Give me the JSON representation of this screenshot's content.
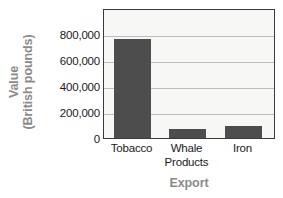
{
  "chart_data": {
    "type": "bar",
    "title": "",
    "xlabel": "Export",
    "ylabel": "Value (British pounds)",
    "ylabel_line1": "Value",
    "ylabel_line2": "(British pounds)",
    "categories": [
      "Tobacco",
      "Whale Products",
      "Iron"
    ],
    "category_lines": [
      [
        "Tobacco"
      ],
      [
        "Whale",
        "Products"
      ],
      [
        "Iron"
      ]
    ],
    "values": [
      760000,
      70000,
      90000
    ],
    "ylim": [
      0,
      1000000
    ],
    "yticks": [
      800000,
      600000,
      400000,
      200000,
      0
    ],
    "ytick_labels": [
      "800,000",
      "600,000",
      "400,000",
      "200,000",
      "0"
    ],
    "grid": true,
    "legend": false,
    "colors": {
      "bar": "#4d4d4d",
      "plot_background": "#f7f7f5",
      "plot_border": "#3a3a3a",
      "gridline": "#bdbdbd",
      "axis_title": "#8a8a8a",
      "tick_label": "#1a1a1a",
      "page_background": "#ffffff"
    }
  }
}
